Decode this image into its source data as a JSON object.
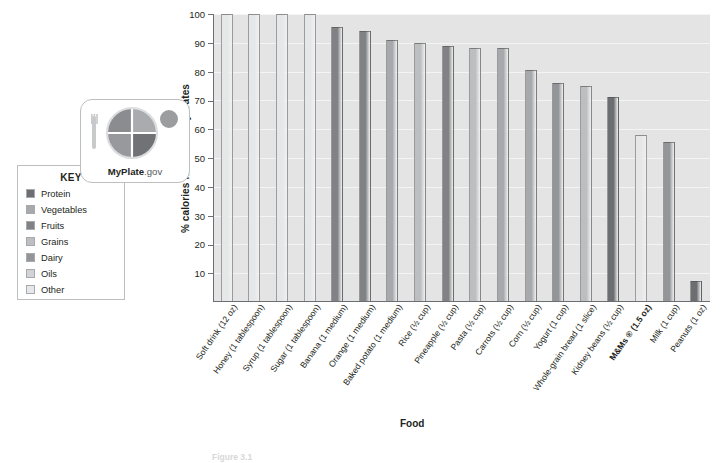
{
  "chart_data": {
    "type": "bar",
    "title": "",
    "xlabel": "Food",
    "ylabel": "% calories from carbohydrates",
    "ylim": [
      0,
      100
    ],
    "yticks": [
      10,
      20,
      30,
      40,
      50,
      60,
      70,
      80,
      90,
      100
    ],
    "grid": true,
    "legend_position": "left",
    "categories": [
      "Soft drink (12 oz)",
      "Honey (1 tablespoon)",
      "Syrup (1 tablespoon)",
      "Sugar (1 tablespoon)",
      "Banana (1 medium)",
      "Orange (1 medium)",
      "Baked potato (1 medium)",
      "Rice (½ cup)",
      "Pineapple (½ cup)",
      "Pasta (½ cup)",
      "Carrots (½ cup)",
      "Corn (½ cup)",
      "Yogurt (1 cup)",
      "Whole-grain bread (1 slice)",
      "Kidney beans (½ cup)",
      "M&Ms ® (1.5 oz)",
      "Milk (1 cup)",
      "Peanuts (1 oz)"
    ],
    "values": [
      100,
      100,
      100,
      100,
      95.5,
      94,
      91,
      90,
      89,
      88,
      88,
      80.5,
      76,
      75,
      71,
      58,
      55.5,
      7
    ],
    "groups": [
      "Other",
      "Other",
      "Other",
      "Other",
      "Fruits",
      "Fruits",
      "Vegetables",
      "Grains",
      "Fruits",
      "Grains",
      "Vegetables",
      "Vegetables",
      "Dairy",
      "Grains",
      "Protein",
      "Other",
      "Dairy",
      "Protein"
    ]
  },
  "key": {
    "title": "KEY",
    "items": [
      {
        "label": "Protein",
        "color": "#6d6e71"
      },
      {
        "label": "Vegetables",
        "color": "#a7a9ac"
      },
      {
        "label": "Fruits",
        "color": "#808285"
      },
      {
        "label": "Grains",
        "color": "#bcbec0"
      },
      {
        "label": "Dairy",
        "color": "#939598"
      },
      {
        "label": "Oils",
        "color": "#d1d3d4"
      },
      {
        "label": "Other",
        "color": "#e6e7e8"
      }
    ]
  },
  "logo": {
    "brand": "MyPlate",
    "suffix": ".gov",
    "icon": "myplate-plate-icon"
  },
  "caption": {
    "figure_number": "Figure 3.1",
    "text": ""
  }
}
